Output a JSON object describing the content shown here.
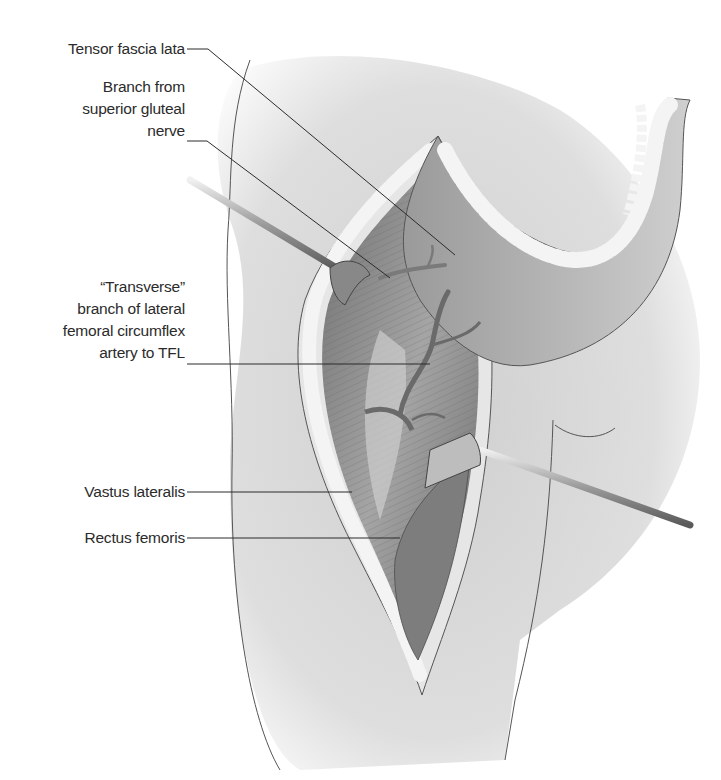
{
  "figure": {
    "labels": [
      {
        "id": "tensor-fascia-lata",
        "lines": [
          "Tensor fascia lata"
        ]
      },
      {
        "id": "branch-superior-gluteal-nerve",
        "lines": [
          "Branch from",
          "superior gluteal",
          "nerve"
        ]
      },
      {
        "id": "transverse-branch-lfca",
        "lines": [
          "“Transverse”",
          "branch of lateral",
          "femoral circumflex",
          "artery to TFL"
        ]
      },
      {
        "id": "vastus-lateralis",
        "lines": [
          "Vastus lateralis"
        ]
      },
      {
        "id": "rectus-femoris",
        "lines": [
          "Rectus femoris"
        ]
      }
    ],
    "colors": {
      "skin": "#d9d9d9",
      "muscle": "#8e8e8e",
      "fat": "#e8e8e8",
      "leader_line": "#2b2b2b",
      "label_text": "#2b2b2b"
    }
  }
}
